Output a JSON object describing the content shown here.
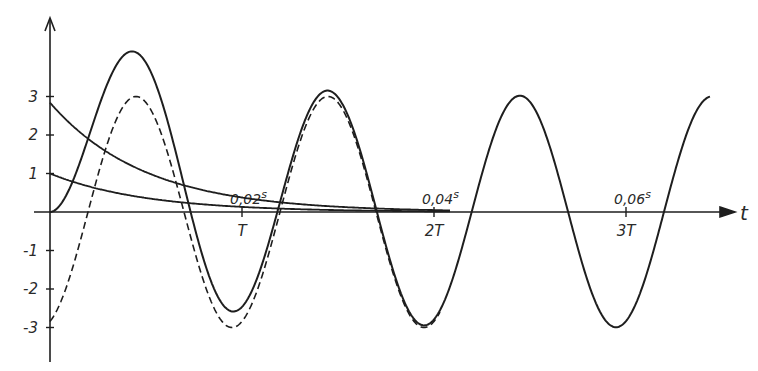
{
  "chart_data": {
    "type": "line",
    "title": "",
    "xlabel": "t",
    "ylabel": "",
    "grid": false,
    "legend": "none",
    "y_ticks": [
      3,
      2,
      1,
      -1,
      -2,
      -3
    ],
    "y_tick_labels": [
      "3",
      "2",
      "1",
      "-1",
      "-2",
      "-3"
    ],
    "x_ticks": [
      {
        "period_label": "T",
        "time_label": "0,02",
        "time_unit": "s",
        "t": 0.02
      },
      {
        "period_label": "2T",
        "time_label": "0,04",
        "time_unit": "s",
        "t": 0.04
      },
      {
        "period_label": "3T",
        "time_label": "0,06",
        "time_unit": "s",
        "t": 0.06
      }
    ],
    "period_s": 0.02,
    "ylim": [
      -3.6,
      4.6
    ],
    "xlim_periods": [
      0,
      3.6
    ],
    "series": [
      {
        "name": "total response (solid)",
        "style": "solid",
        "description": "steady sinusoid plus decaying offset; starts at 0, first peak ≈ 4.2, first trough ≈ -2.6, then settles to ±3",
        "samples": [
          [
            0,
            0
          ],
          [
            0.2,
            4.15
          ],
          [
            0.5,
            -2.63
          ],
          [
            1.0,
            3.1
          ],
          [
            1.5,
            -3.0
          ],
          [
            2.0,
            3.0
          ],
          [
            2.5,
            -3.0
          ],
          [
            3.0,
            3.0
          ]
        ]
      },
      {
        "name": "steady-state (dashed)",
        "style": "dashed",
        "amplitude": 3,
        "description": "3·sin(2π(t/T − 0.198)); starts at ≈ -2.84",
        "samples": [
          [
            0,
            -2.84
          ],
          [
            0.2,
            2.95
          ],
          [
            0.5,
            -3.0
          ],
          [
            1.0,
            3.0
          ],
          [
            1.5,
            -3.0
          ]
        ]
      },
      {
        "name": "decaying component A",
        "style": "solid",
        "initial": 2.84,
        "description": "exponential decay from ≈2.84, ≈0.38 at T",
        "samples": [
          [
            0,
            2.84
          ],
          [
            0.5,
            1.03
          ],
          [
            1.0,
            0.38
          ],
          [
            1.5,
            0.14
          ],
          [
            2.0,
            0.05
          ]
        ]
      },
      {
        "name": "decaying component B",
        "style": "solid",
        "initial": 1.0,
        "description": "exponential decay from 1, ≈0.13 at T",
        "samples": [
          [
            0,
            1.0
          ],
          [
            0.5,
            0.36
          ],
          [
            1.0,
            0.13
          ],
          [
            1.5,
            0.05
          ],
          [
            2.0,
            0.02
          ]
        ]
      }
    ]
  },
  "geometry": {
    "origin_x": 50,
    "origin_y": 212,
    "px_per_unit_y": 38.5,
    "px_per_period": 192,
    "phase_px": 38,
    "tau_px": 95,
    "x_end": 710,
    "dashed_end": 440
  },
  "colors": {
    "ink": "#1e1e1e",
    "background": "#ffffff"
  }
}
